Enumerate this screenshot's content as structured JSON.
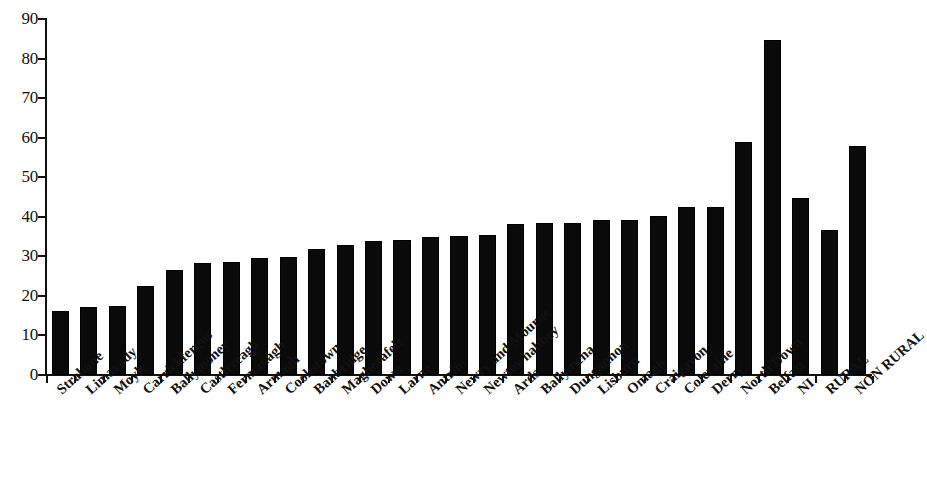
{
  "chart_data": {
    "type": "bar",
    "title": "",
    "subtitle": "",
    "xlabel": "",
    "ylabel": "",
    "ylim": [
      0,
      90
    ],
    "ytick_labels": [
      "0",
      "10",
      "20",
      "30",
      "40",
      "50",
      "60",
      "70",
      "80",
      "90"
    ],
    "ytick_values": [
      0,
      10,
      20,
      30,
      40,
      50,
      60,
      70,
      80,
      90
    ],
    "ytick_step": 10,
    "grid": false,
    "legend": null,
    "bar_color": "#0a0a0a",
    "background_color": "#ffffff",
    "axis_color": "#111111",
    "categories": [
      "Strabane",
      "Limavady",
      "Moyle",
      "Carrickfergus",
      "Ballymoney",
      "Castlereagh",
      "Fermanagh",
      "Armagh",
      "Cookstown",
      "Banbridge",
      "Magherafelt",
      "Down",
      "Larne",
      "Antrim",
      "Newry and Mourne",
      "Newtownabbey",
      "Ards",
      "Ballymena",
      "Dungannon",
      "Lisburn",
      "Omagh",
      "Craigavon",
      "Coleraine",
      "Derry",
      "North Down",
      "Belfast",
      "NI",
      "RURAL",
      "NON RURAL"
    ],
    "values": [
      16.2,
      17.3,
      17.5,
      22.4,
      26.5,
      28.4,
      28.5,
      29.6,
      29.9,
      31.9,
      32.9,
      33.9,
      34.2,
      34.9,
      35.1,
      35.3,
      38.1,
      38.4,
      38.5,
      39.1,
      39.3,
      40.3,
      42.4,
      42.5,
      58.9,
      84.7,
      44.8,
      36.7,
      58.0
    ]
  }
}
